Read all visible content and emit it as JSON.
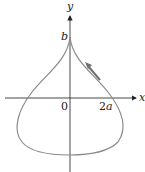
{
  "diagram": {
    "axes": {
      "x_label": "x",
      "y_label": "y"
    },
    "labels": {
      "origin": "0",
      "x_tick": "2",
      "x_tick_var": "a",
      "y_tick": "b"
    },
    "colors": {
      "axis": "#222222",
      "curve": "#8a8a8a",
      "arrow": "#6f6f6f"
    }
  }
}
